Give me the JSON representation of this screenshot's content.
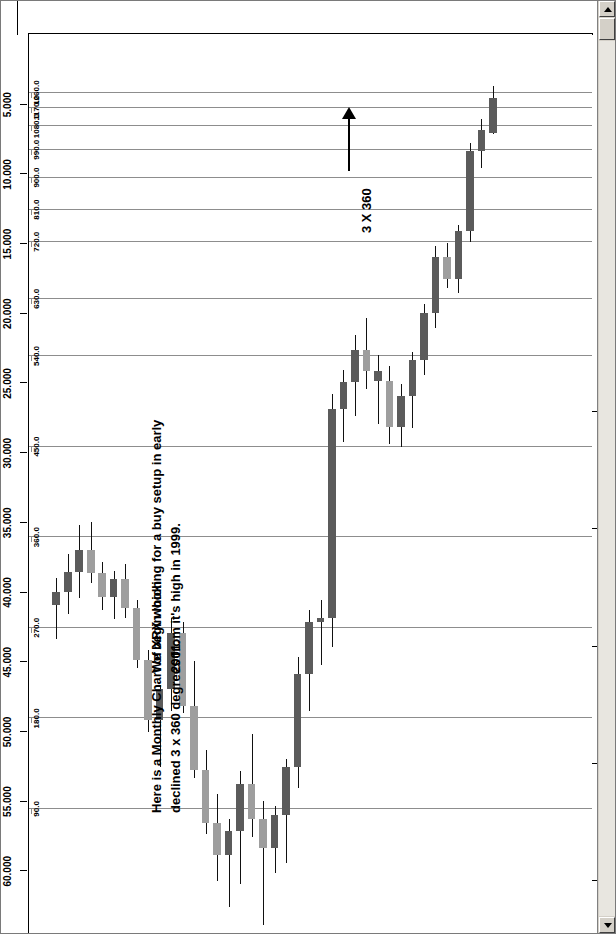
{
  "window": {
    "scrollbar": {
      "up_icon": "scroll-up-arrow",
      "down_icon": "scroll-down-arrow"
    }
  },
  "quote_bar": {
    "symbol": "(XRX) XEROX CORP-Monthly",
    "date": "12/29/2000",
    "close": "C=4.625",
    "change": "-2.313",
    "change_pct": "-33.34%",
    "open": "O=7.125",
    "high": "H=7.188",
    "low": "L=3.750",
    "volume": "V=226454900",
    "indicator": "-1.1 Square Price(63.938,-90,4,FALSE)",
    "sub_label": "0 Deg. 0.3.94"
  },
  "annotations": [
    {
      "id": "anno-chart-description",
      "text": "Here is a Monthly Chart of XRX which\ndeclined 3 x 360 degrees from it's high in 1999."
    },
    {
      "id": "anno-buy-setup",
      "text": "We begin looking for a buy setup in early\n2001."
    },
    {
      "id": "anno-three-by-360",
      "text": "3 X 360"
    }
  ],
  "chart_data": {
    "type": "candlestick",
    "title": "(XRX) XEROX CORP-Monthly",
    "xlabel": "",
    "ylabel": "Price",
    "grid": true,
    "legend": "none",
    "orientation": "rotated-90",
    "price_axis": {
      "label": "Price",
      "ticks": [
        "60.000",
        "55.000",
        "50.000",
        "45.000",
        "40.000",
        "35.000",
        "30.000",
        "25.000",
        "20.000",
        "15.000",
        "10.000",
        "5.000"
      ],
      "values": [
        60,
        55,
        50,
        45,
        40,
        35,
        30,
        25,
        20,
        15,
        10,
        5
      ],
      "range": [
        0,
        65
      ]
    },
    "time_axis": {
      "label": "Year",
      "ticks": [
        "1998",
        "1999",
        "2000",
        "2001",
        "2002"
      ],
      "values": [
        1998,
        1999,
        2000,
        2001,
        2002
      ]
    },
    "gann_rays": {
      "label": "Square Price angle rays (degrees)",
      "ticks": [
        "90.0",
        "180.0",
        "270.0",
        "360.0",
        "450.0",
        "540.0",
        "630.0",
        "720.0",
        "810.0",
        "900.0",
        "990.0",
        "1080.0",
        "1170.0",
        "1260.0"
      ],
      "values": [
        90,
        180,
        270,
        360,
        450,
        540,
        630,
        720,
        810,
        900,
        990,
        1080,
        1170,
        1260
      ],
      "price_at_ray": [
        55.6,
        49.1,
        42.6,
        36.1,
        29.6,
        23.1,
        19.0,
        14.9,
        12.6,
        10.3,
        8.3,
        6.6,
        5.3,
        4.2
      ]
    },
    "series_name": "XRX monthly OHLC",
    "candles": [
      {
        "t": "1997-10",
        "o": 41.0,
        "h": 43.4,
        "l": 39.0,
        "c": 40.0,
        "dir": "down"
      },
      {
        "t": "1997-11",
        "o": 40.0,
        "h": 41.6,
        "l": 37.3,
        "c": 38.6,
        "dir": "down"
      },
      {
        "t": "1997-12",
        "o": 38.6,
        "h": 40.5,
        "l": 35.2,
        "c": 37.0,
        "dir": "down"
      },
      {
        "t": "1998-01",
        "o": 37.0,
        "h": 39.4,
        "l": 35.0,
        "c": 38.7,
        "dir": "up"
      },
      {
        "t": "1998-02",
        "o": 38.7,
        "h": 41.3,
        "l": 37.9,
        "c": 40.4,
        "dir": "up"
      },
      {
        "t": "1998-03",
        "o": 40.4,
        "h": 42.0,
        "l": 38.5,
        "c": 39.1,
        "dir": "down"
      },
      {
        "t": "1998-04",
        "o": 39.1,
        "h": 41.9,
        "l": 38.0,
        "c": 41.2,
        "dir": "up"
      },
      {
        "t": "1998-05",
        "o": 41.2,
        "h": 45.5,
        "l": 40.6,
        "c": 44.9,
        "dir": "up"
      },
      {
        "t": "1998-06",
        "o": 44.9,
        "h": 50.1,
        "l": 44.2,
        "c": 49.2,
        "dir": "up"
      },
      {
        "t": "1998-07",
        "o": 49.2,
        "h": 52.6,
        "l": 46.7,
        "c": 47.0,
        "dir": "down"
      },
      {
        "t": "1998-08",
        "o": 47.0,
        "h": 48.6,
        "l": 41.9,
        "c": 43.0,
        "dir": "down"
      },
      {
        "t": "1998-09",
        "o": 43.0,
        "h": 48.7,
        "l": 42.2,
        "c": 48.2,
        "dir": "up"
      },
      {
        "t": "1998-10",
        "o": 48.2,
        "h": 53.4,
        "l": 45.0,
        "c": 52.8,
        "dir": "up"
      },
      {
        "t": "1998-11",
        "o": 52.8,
        "h": 57.4,
        "l": 51.4,
        "c": 56.6,
        "dir": "up"
      },
      {
        "t": "1998-12",
        "o": 56.6,
        "h": 60.8,
        "l": 54.5,
        "c": 58.9,
        "dir": "up"
      },
      {
        "t": "1999-01",
        "o": 58.9,
        "h": 62.6,
        "l": 56.3,
        "c": 57.2,
        "dir": "down"
      },
      {
        "t": "1999-02",
        "o": 57.2,
        "h": 61.0,
        "l": 52.9,
        "c": 53.8,
        "dir": "down"
      },
      {
        "t": "1999-03",
        "o": 53.8,
        "h": 57.6,
        "l": 50.2,
        "c": 56.3,
        "dir": "up"
      },
      {
        "t": "1999-04",
        "o": 56.3,
        "h": 63.9,
        "l": 55.0,
        "c": 58.4,
        "dir": "up"
      },
      {
        "t": "1999-05",
        "o": 58.4,
        "h": 60.2,
        "l": 55.4,
        "c": 56.0,
        "dir": "down"
      },
      {
        "t": "1999-06",
        "o": 56.0,
        "h": 59.5,
        "l": 52.0,
        "c": 52.6,
        "dir": "down"
      },
      {
        "t": "1999-07",
        "o": 52.6,
        "h": 54.1,
        "l": 44.7,
        "c": 45.9,
        "dir": "down"
      },
      {
        "t": "1999-08",
        "o": 45.9,
        "h": 48.6,
        "l": 41.3,
        "c": 42.2,
        "dir": "down"
      },
      {
        "t": "1999-09",
        "o": 42.2,
        "h": 45.3,
        "l": 40.6,
        "c": 41.9,
        "dir": "down"
      },
      {
        "t": "1999-10",
        "o": 41.9,
        "h": 44.0,
        "l": 25.8,
        "c": 26.9,
        "dir": "down"
      },
      {
        "t": "1999-11",
        "o": 26.9,
        "h": 29.3,
        "l": 24.1,
        "c": 25.0,
        "dir": "down"
      },
      {
        "t": "1999-12",
        "o": 25.0,
        "h": 27.4,
        "l": 21.6,
        "c": 22.7,
        "dir": "down"
      },
      {
        "t": "2000-01",
        "o": 22.7,
        "h": 25.5,
        "l": 20.4,
        "c": 24.2,
        "dir": "up"
      },
      {
        "t": "2000-02",
        "o": 24.2,
        "h": 28.0,
        "l": 23.0,
        "c": 24.9,
        "dir": "down"
      },
      {
        "t": "2000-03",
        "o": 24.9,
        "h": 29.4,
        "l": 23.8,
        "c": 28.2,
        "dir": "up"
      },
      {
        "t": "2000-04",
        "o": 28.2,
        "h": 29.6,
        "l": 25.1,
        "c": 26.0,
        "dir": "down"
      },
      {
        "t": "2000-05",
        "o": 26.0,
        "h": 28.3,
        "l": 22.8,
        "c": 23.4,
        "dir": "down"
      },
      {
        "t": "2000-06",
        "o": 23.4,
        "h": 24.5,
        "l": 19.4,
        "c": 20.0,
        "dir": "down"
      },
      {
        "t": "2000-07",
        "o": 20.0,
        "h": 21.1,
        "l": 15.2,
        "c": 16.0,
        "dir": "down"
      },
      {
        "t": "2000-08",
        "o": 16.0,
        "h": 18.2,
        "l": 15.0,
        "c": 17.6,
        "dir": "up"
      },
      {
        "t": "2000-09",
        "o": 17.6,
        "h": 18.6,
        "l": 13.7,
        "c": 14.1,
        "dir": "down"
      },
      {
        "t": "2000-10",
        "o": 14.1,
        "h": 14.9,
        "l": 7.8,
        "c": 8.4,
        "dir": "down"
      },
      {
        "t": "2000-11",
        "o": 8.4,
        "h": 9.6,
        "l": 6.1,
        "c": 6.9,
        "dir": "down"
      },
      {
        "t": "2000-12",
        "o": 7.125,
        "h": 7.188,
        "l": 3.75,
        "c": 4.625,
        "dir": "down"
      }
    ]
  }
}
